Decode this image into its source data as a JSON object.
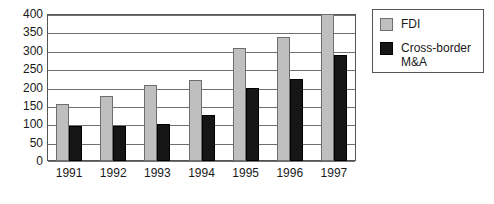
{
  "chart_data": {
    "type": "bar",
    "title": "",
    "xlabel": "",
    "ylabel": "",
    "categories": [
      "1991",
      "1992",
      "1993",
      "1994",
      "1995",
      "1996",
      "1997"
    ],
    "series": [
      {
        "name": "FDI",
        "color": "#bfbfbf",
        "values": [
          155,
          177,
          207,
          220,
          308,
          337,
          400
        ]
      },
      {
        "name": "Cross-border M&A",
        "color": "#161616",
        "values": [
          96,
          96,
          100,
          125,
          200,
          222,
          288
        ]
      }
    ],
    "ylim": [
      0,
      400
    ],
    "ytick_step": 50,
    "yticks": [
      "0",
      "50",
      "100",
      "150",
      "200",
      "250",
      "300",
      "350",
      "400"
    ],
    "grid": true,
    "legend_position": "right",
    "legend_entries": [
      "FDI",
      "Cross-border M&A"
    ]
  },
  "legend": {
    "items": [
      {
        "label": "FDI",
        "swatch": "gray-swatch-icon"
      },
      {
        "label": "Cross-border M&A",
        "swatch": "black-swatch-icon"
      }
    ]
  },
  "colors": {
    "fdi": "#bfbfbf",
    "mna": "#161616",
    "grid": "#707070",
    "frame": "#555555",
    "text": "#1a1a1a",
    "background": "#ffffff"
  }
}
